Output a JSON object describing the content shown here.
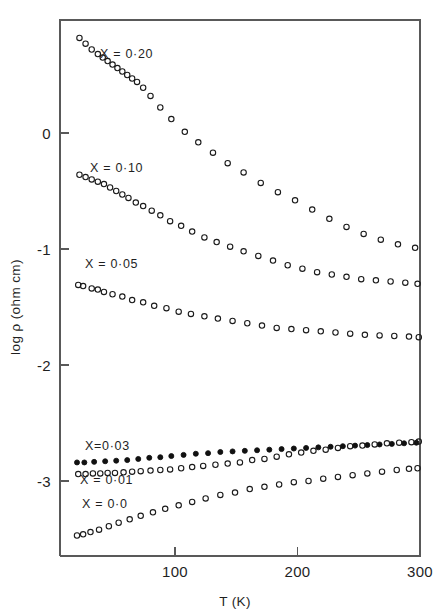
{
  "figure": {
    "background_color": "#ffffff",
    "ink_color": "#1a1a1a",
    "axis_color": "#595959"
  },
  "chart_data": {
    "type": "scatter",
    "title": "",
    "subtitle": "",
    "xlabel": "T (K)",
    "ylabel": "log ρ (ohm cm)",
    "xlim": [
      6,
      300
    ],
    "ylim": [
      -3.62,
      0.98
    ],
    "xticks": [
      100,
      200,
      300
    ],
    "xticklabels": [
      "100",
      "200",
      "300"
    ],
    "yticks": [
      0,
      -1,
      -2,
      -3
    ],
    "yticklabels": [
      "0",
      "-1",
      "-2",
      "-3"
    ],
    "grid": false,
    "legend": "inline-annotations",
    "annotations": [
      {
        "text": "X = 0·20",
        "x_px": 100,
        "y_px": 58,
        "series": "X = 0.20"
      },
      {
        "text": "X = 0·10",
        "x_px": 90,
        "y_px": 172,
        "series": "X = 0.10"
      },
      {
        "text": "X = 0·05",
        "x_px": 85,
        "y_px": 268,
        "series": "X = 0.05"
      },
      {
        "text": "X=0·03",
        "x_px": 85,
        "y_px": 450,
        "series": "X = 0.03"
      },
      {
        "text": "X = 0·01",
        "x_px": 80,
        "y_px": 484,
        "series": "X = 0.01"
      },
      {
        "text": "X = 0·0",
        "x_px": 82,
        "y_px": 508,
        "series": "X = 0.0"
      }
    ],
    "series": [
      {
        "name": "X = 0.20",
        "marker": "open-circle",
        "x": [
          22,
          27,
          32,
          37,
          41,
          45,
          49,
          53,
          57,
          61,
          65,
          69,
          74,
          80,
          88,
          97,
          108,
          119,
          131,
          143,
          156,
          170,
          184,
          198,
          212,
          226,
          240,
          254,
          268,
          282,
          296
        ],
        "y": [
          0.82,
          0.77,
          0.72,
          0.68,
          0.65,
          0.62,
          0.59,
          0.56,
          0.53,
          0.5,
          0.47,
          0.44,
          0.39,
          0.32,
          0.22,
          0.12,
          0.01,
          -0.08,
          -0.17,
          -0.26,
          -0.34,
          -0.43,
          -0.51,
          -0.58,
          -0.66,
          -0.74,
          -0.81,
          -0.87,
          -0.92,
          -0.96,
          -0.99
        ]
      },
      {
        "name": "X = 0.10",
        "marker": "open-circle",
        "x": [
          22,
          27,
          32,
          37,
          42,
          47,
          52,
          57,
          62,
          68,
          74,
          81,
          88,
          96,
          105,
          114,
          124,
          134,
          145,
          156,
          168,
          180,
          192,
          204,
          216,
          228,
          240,
          252,
          264,
          276,
          288,
          298
        ],
        "y": [
          -0.36,
          -0.38,
          -0.4,
          -0.42,
          -0.44,
          -0.47,
          -0.5,
          -0.53,
          -0.56,
          -0.6,
          -0.63,
          -0.67,
          -0.71,
          -0.76,
          -0.8,
          -0.85,
          -0.9,
          -0.94,
          -0.98,
          -1.02,
          -1.06,
          -1.1,
          -1.14,
          -1.17,
          -1.2,
          -1.22,
          -1.24,
          -1.26,
          -1.27,
          -1.28,
          -1.29,
          -1.3
        ]
      },
      {
        "name": "X = 0.05",
        "marker": "open-circle",
        "x": [
          21,
          25,
          32,
          37,
          42,
          49,
          57,
          65,
          74,
          83,
          93,
          103,
          113,
          124,
          135,
          147,
          159,
          171,
          183,
          195,
          207,
          219,
          231,
          243,
          255,
          267,
          279,
          291,
          299
        ],
        "y": [
          -1.31,
          -1.32,
          -1.34,
          -1.35,
          -1.37,
          -1.39,
          -1.41,
          -1.44,
          -1.46,
          -1.49,
          -1.51,
          -1.54,
          -1.56,
          -1.58,
          -1.6,
          -1.62,
          -1.64,
          -1.66,
          -1.68,
          -1.69,
          -1.7,
          -1.71,
          -1.72,
          -1.73,
          -1.74,
          -1.745,
          -1.75,
          -1.755,
          -1.76
        ]
      },
      {
        "name": "X = 0.03",
        "marker": "filled-circle",
        "x": [
          20,
          26,
          34,
          43,
          52,
          61,
          70,
          79,
          88,
          97,
          107,
          117,
          127,
          137,
          147,
          157,
          167,
          177,
          187,
          197,
          207,
          217,
          227,
          237,
          247,
          257,
          267,
          277,
          287,
          297
        ],
        "y": [
          -2.84,
          -2.84,
          -2.835,
          -2.83,
          -2.825,
          -2.82,
          -2.81,
          -2.8,
          -2.795,
          -2.785,
          -2.775,
          -2.765,
          -2.76,
          -2.75,
          -2.745,
          -2.74,
          -2.735,
          -2.73,
          -2.725,
          -2.72,
          -2.715,
          -2.71,
          -2.705,
          -2.7,
          -2.695,
          -2.69,
          -2.685,
          -2.68,
          -2.675,
          -2.67
        ]
      },
      {
        "name": "X = 0.01",
        "marker": "open-circle",
        "x": [
          21,
          27,
          33,
          39,
          45,
          51,
          58,
          65,
          72,
          80,
          88,
          96,
          105,
          114,
          123,
          133,
          143,
          153,
          163,
          173,
          183,
          193,
          203,
          213,
          223,
          233,
          243,
          253,
          263,
          273,
          283,
          293,
          299
        ],
        "y": [
          -2.94,
          -2.94,
          -2.935,
          -2.935,
          -2.93,
          -2.93,
          -2.925,
          -2.92,
          -2.915,
          -2.91,
          -2.905,
          -2.9,
          -2.89,
          -2.88,
          -2.87,
          -2.86,
          -2.85,
          -2.84,
          -2.82,
          -2.81,
          -2.79,
          -2.77,
          -2.755,
          -2.74,
          -2.73,
          -2.715,
          -2.7,
          -2.695,
          -2.685,
          -2.675,
          -2.67,
          -2.665,
          -2.66
        ]
      },
      {
        "name": "X = 0.0",
        "marker": "open-circle",
        "x": [
          20,
          25,
          31,
          38,
          46,
          54,
          63,
          72,
          82,
          92,
          103,
          114,
          125,
          137,
          149,
          161,
          173,
          185,
          197,
          209,
          221,
          233,
          245,
          257,
          269,
          281,
          291,
          298
        ],
        "y": [
          -3.47,
          -3.46,
          -3.44,
          -3.42,
          -3.39,
          -3.36,
          -3.33,
          -3.3,
          -3.27,
          -3.24,
          -3.21,
          -3.18,
          -3.15,
          -3.12,
          -3.1,
          -3.07,
          -3.05,
          -3.03,
          -3.01,
          -3.0,
          -2.98,
          -2.965,
          -2.95,
          -2.935,
          -2.92,
          -2.905,
          -2.895,
          -2.89
        ]
      }
    ]
  }
}
